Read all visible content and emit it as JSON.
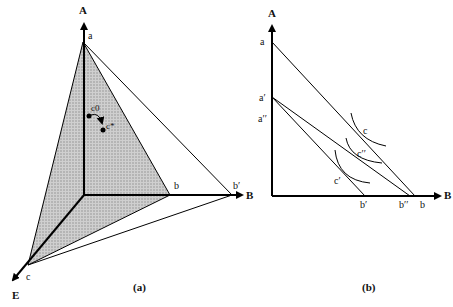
{
  "panel_a": {
    "caption": "(a)",
    "axes": {
      "A": "A",
      "B": "B",
      "E": "E"
    },
    "points": {
      "a": "a",
      "b": "b",
      "b_prime": "b′",
      "c": "c",
      "c0": "c0",
      "c_star": "c*"
    },
    "shading_color": "#bdbdbd"
  },
  "panel_b": {
    "caption": "(b)",
    "axes": {
      "A": "A",
      "B": "B"
    },
    "points": {
      "a": "a",
      "a_prime": "a′",
      "a_dprime": "a′′",
      "b_prime": "b′",
      "b_dprime": "b′′",
      "b": "b",
      "c": "c",
      "c_dprime": "c′′",
      "c_prime": "c′"
    }
  }
}
